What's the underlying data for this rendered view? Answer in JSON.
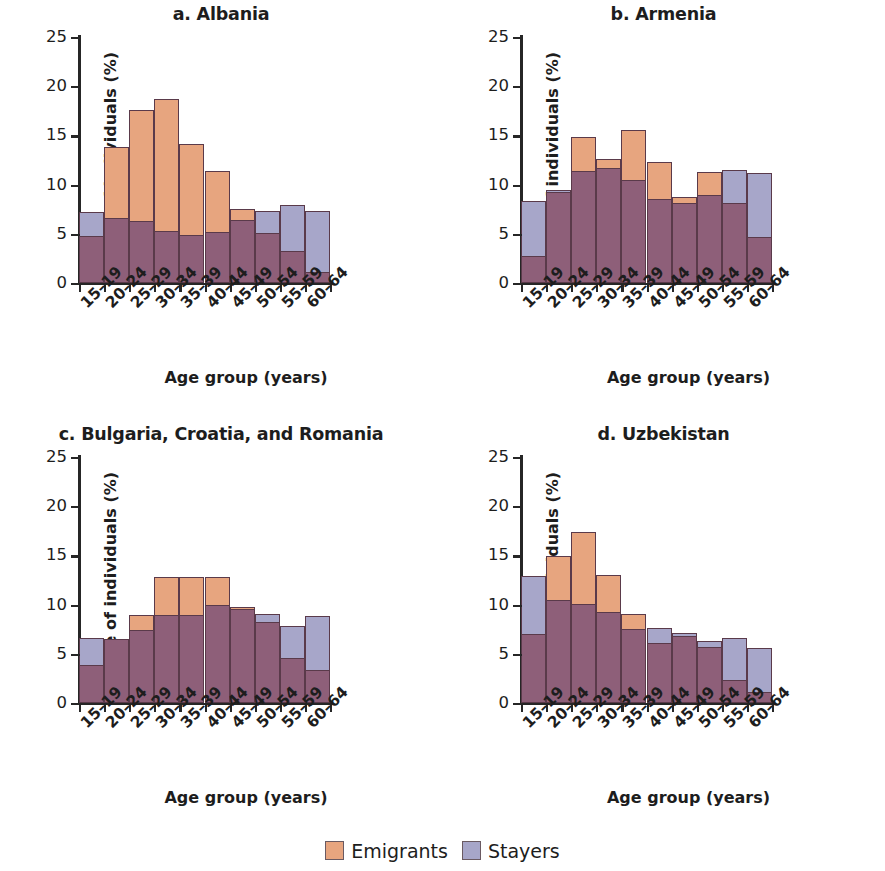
{
  "figure": {
    "ylabel": "Share of individuals (%)",
    "xlabel": "Age group (years)",
    "ylim": [
      0,
      25
    ],
    "yticks": [
      "0",
      "5",
      "10",
      "15",
      "20",
      "25"
    ],
    "categories": [
      "15–19",
      "20–24",
      "25–29",
      "30–34",
      "35–39",
      "40–44",
      "45–49",
      "50–54",
      "55–59",
      "60–64"
    ],
    "legend": [
      {
        "label": "Emigrants",
        "color": "#E7A57F"
      },
      {
        "label": "Stayers",
        "color": "#A7A6C9"
      }
    ],
    "overlap_color": "#8E5F79",
    "edge_color": "#5A3A4A"
  },
  "panels": [
    {
      "id": "a",
      "title": "a. Albania"
    },
    {
      "id": "b",
      "title": "b. Armenia"
    },
    {
      "id": "c",
      "title": "c. Bulgaria, Croatia, and Romania"
    },
    {
      "id": "d",
      "title": "d. Uzbekistan"
    }
  ],
  "chart_data": [
    {
      "type": "bar",
      "title": "a. Albania",
      "xlabel": "Age group (years)",
      "ylabel": "Share of individuals (%)",
      "ylim": [
        0,
        25
      ],
      "grid": false,
      "legend_position": "bottom-center",
      "categories": [
        "15–19",
        "20–24",
        "25–29",
        "30–34",
        "35–39",
        "40–44",
        "45–49",
        "50–54",
        "55–59",
        "60–64"
      ],
      "series": [
        {
          "name": "Emigrants",
          "values": [
            4.8,
            13.8,
            17.6,
            18.7,
            14.1,
            11.4,
            7.5,
            5.1,
            3.3,
            1.1
          ]
        },
        {
          "name": "Stayers",
          "values": [
            7.2,
            6.6,
            6.3,
            5.3,
            4.9,
            5.2,
            6.4,
            7.3,
            7.9,
            7.3
          ]
        }
      ]
    },
    {
      "type": "bar",
      "title": "b. Armenia",
      "xlabel": "Age group (years)",
      "ylabel": "Share of individuals (%)",
      "ylim": [
        0,
        25
      ],
      "grid": false,
      "legend_position": "bottom-center",
      "categories": [
        "15–19",
        "20–24",
        "25–29",
        "30–34",
        "35–39",
        "40–44",
        "45–49",
        "50–54",
        "55–59",
        "60–64"
      ],
      "series": [
        {
          "name": "Emigrants",
          "values": [
            2.7,
            9.2,
            14.8,
            12.6,
            15.5,
            12.3,
            8.7,
            11.3,
            8.1,
            4.7
          ]
        },
        {
          "name": "Stayers",
          "values": [
            8.3,
            9.5,
            11.4,
            11.7,
            10.5,
            8.5,
            8.1,
            8.9,
            11.5,
            11.2
          ]
        }
      ]
    },
    {
      "type": "bar",
      "title": "c. Bulgaria, Croatia, and Romania",
      "xlabel": "Age group (years)",
      "ylabel": "Share of individuals (%)",
      "ylim": [
        0,
        25
      ],
      "grid": false,
      "legend_position": "bottom-center",
      "categories": [
        "15–19",
        "20–24",
        "25–29",
        "30–34",
        "35–39",
        "40–44",
        "45–49",
        "50–54",
        "55–59",
        "60–64"
      ],
      "series": [
        {
          "name": "Emigrants",
          "values": [
            3.9,
            6.5,
            8.9,
            12.8,
            12.8,
            12.8,
            9.8,
            8.2,
            4.6,
            3.4
          ]
        },
        {
          "name": "Stayers",
          "values": [
            6.6,
            6.5,
            7.4,
            8.9,
            8.9,
            10.0,
            9.6,
            9.0,
            7.8,
            8.8
          ]
        }
      ]
    },
    {
      "type": "bar",
      "title": "d. Uzbekistan",
      "xlabel": "Age group (years)",
      "ylabel": "Share of individuals (%)",
      "ylim": [
        0,
        25
      ],
      "grid": false,
      "legend_position": "bottom-center",
      "categories": [
        "15–19",
        "20–24",
        "25–29",
        "30–34",
        "35–39",
        "40–44",
        "45–49",
        "50–54",
        "55–59",
        "60–64"
      ],
      "series": [
        {
          "name": "Emigrants",
          "values": [
            7.0,
            14.9,
            17.4,
            13.0,
            9.0,
            6.1,
            6.8,
            5.7,
            2.3,
            1.1
          ]
        },
        {
          "name": "Stayers",
          "values": [
            12.9,
            10.5,
            10.1,
            9.3,
            7.5,
            7.6,
            7.1,
            6.3,
            6.6,
            5.6
          ]
        }
      ]
    }
  ]
}
